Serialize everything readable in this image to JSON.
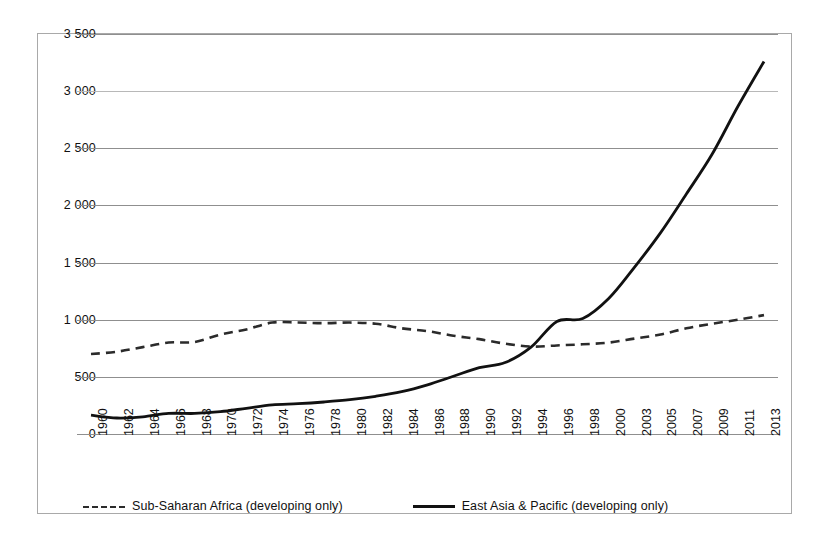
{
  "chart_data": {
    "type": "line",
    "title": "",
    "subtitle": "",
    "xlabel": "",
    "ylabel": "",
    "ylim": [
      0,
      3500
    ],
    "ytick_step": 500,
    "grid": "horizontal",
    "legend_position": "bottom",
    "y_ticks": [
      "0",
      "500",
      "1 000",
      "1 500",
      "2 000",
      "2 500",
      "3 000",
      "3 500"
    ],
    "y_tick_values": [
      0,
      500,
      1000,
      1500,
      2000,
      2500,
      3000,
      3500
    ],
    "categories": [
      "1960",
      "1962",
      "1964",
      "1966",
      "1968",
      "1970",
      "1972",
      "1974",
      "1976",
      "1978",
      "1980",
      "1982",
      "1984",
      "1986",
      "1988",
      "1990",
      "1992",
      "1994",
      "1996",
      "1998",
      "2000",
      "2003",
      "2005",
      "2007",
      "2009",
      "2011",
      "2013"
    ],
    "series": [
      {
        "name": "Sub-Saharan Africa (developing only)",
        "style": "dashed",
        "color": "#2b2b2b",
        "values": [
          700,
          720,
          760,
          800,
          805,
          870,
          915,
          975,
          975,
          970,
          975,
          965,
          925,
          900,
          860,
          830,
          790,
          765,
          775,
          785,
          800,
          835,
          870,
          925,
          965,
          1000,
          1040
        ]
      },
      {
        "name": "East Asia & Pacific (developing only)",
        "style": "solid",
        "color": "#111111",
        "values": [
          165,
          140,
          150,
          180,
          180,
          195,
          225,
          255,
          265,
          280,
          300,
          330,
          370,
          430,
          505,
          580,
          625,
          760,
          985,
          1010,
          1185,
          1460,
          1760,
          2100,
          2450,
          2870,
          3260
        ]
      }
    ]
  },
  "legend": {
    "items": [
      {
        "label": "Sub-Saharan Africa (developing only)",
        "style": "dashed"
      },
      {
        "label": "East Asia & Pacific (developing only)",
        "style": "solid"
      }
    ]
  }
}
